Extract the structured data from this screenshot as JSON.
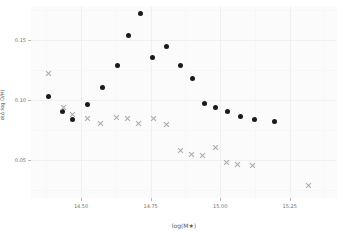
{
  "chart_data": {
    "type": "scatter",
    "title": "",
    "xlabel": "log(M★)",
    "ylabel": "σ(Δ log O/H)",
    "xlim": [
      14.32,
      15.42
    ],
    "ylim": [
      0.018,
      0.178
    ],
    "grid": true,
    "legend_position": "none",
    "xticks": [
      14.5,
      14.75,
      15.0,
      15.25
    ],
    "xtick_labels": [
      "14.50",
      "14.75",
      "15.00",
      "15.25"
    ],
    "yticks": [
      0.05,
      0.1,
      0.15
    ],
    "ytick_labels": [
      "0.05",
      "0.10",
      "0.15"
    ],
    "xticks_minor": [
      14.375,
      14.625,
      14.875,
      15.125,
      15.375
    ],
    "yticks_minor": [
      0.025,
      0.075,
      0.125,
      0.175
    ],
    "series": [
      {
        "name": "filled-circles",
        "marker": "circle",
        "color": "#1a1a1a",
        "points": [
          {
            "x": 14.382,
            "y": 0.1022
          },
          {
            "x": 14.434,
            "y": 0.0905
          },
          {
            "x": 14.47,
            "y": 0.0838
          },
          {
            "x": 14.524,
            "y": 0.0962
          },
          {
            "x": 14.578,
            "y": 0.1097
          },
          {
            "x": 14.632,
            "y": 0.1288
          },
          {
            "x": 14.672,
            "y": 0.1538
          },
          {
            "x": 14.712,
            "y": 0.1718
          },
          {
            "x": 14.756,
            "y": 0.1352
          },
          {
            "x": 14.806,
            "y": 0.1442
          },
          {
            "x": 14.856,
            "y": 0.1288
          },
          {
            "x": 14.9,
            "y": 0.1178
          },
          {
            "x": 14.944,
            "y": 0.0968
          },
          {
            "x": 14.982,
            "y": 0.0938
          },
          {
            "x": 15.026,
            "y": 0.0898
          },
          {
            "x": 15.074,
            "y": 0.0862
          },
          {
            "x": 15.122,
            "y": 0.0832
          },
          {
            "x": 15.196,
            "y": 0.0818
          }
        ]
      },
      {
        "name": "gray-crosses",
        "marker": "cross",
        "color": "#a8a8a8",
        "points": [
          {
            "x": 14.382,
            "y": 0.1218
          },
          {
            "x": 14.436,
            "y": 0.0938
          },
          {
            "x": 14.47,
            "y": 0.0872
          },
          {
            "x": 14.524,
            "y": 0.0842
          },
          {
            "x": 14.57,
            "y": 0.08
          },
          {
            "x": 14.626,
            "y": 0.0852
          },
          {
            "x": 14.668,
            "y": 0.0842
          },
          {
            "x": 14.706,
            "y": 0.0802
          },
          {
            "x": 14.76,
            "y": 0.0842
          },
          {
            "x": 14.806,
            "y": 0.0792
          },
          {
            "x": 14.856,
            "y": 0.0572
          },
          {
            "x": 14.896,
            "y": 0.0542
          },
          {
            "x": 14.936,
            "y": 0.0532
          },
          {
            "x": 14.982,
            "y": 0.0598
          },
          {
            "x": 15.022,
            "y": 0.0478
          },
          {
            "x": 15.064,
            "y": 0.0462
          },
          {
            "x": 15.118,
            "y": 0.0452
          },
          {
            "x": 15.316,
            "y": 0.0282
          }
        ]
      }
    ]
  }
}
